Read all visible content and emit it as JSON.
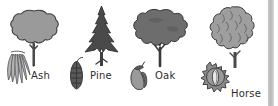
{
  "figure": {
    "kind": "tree-identification-chart",
    "background_color": "#ffffff",
    "ink_color": "#2e2e2e",
    "palette": {
      "canopy_light": "#9a9a9a",
      "canopy_mid": "#8a8a8a",
      "canopy_dark": "#4a4a4a",
      "outline": "#3a3a3a",
      "trunk": "#4a4a4a",
      "seed_light": "#b0b0b0",
      "seed_dark": "#4f4f4f",
      "edge_strip": "#c0c0c0"
    }
  },
  "species": [
    {
      "id": "ash",
      "label": "Ash",
      "tree_icon": "ash-tree-icon",
      "seed_icon": "ash-keys-icon",
      "seed_name": "ash keys",
      "canopy_shape": "rounded lobed",
      "canopy_color": "#9a9a9a"
    },
    {
      "id": "pine",
      "label": "Pine",
      "tree_icon": "pine-tree-icon",
      "seed_icon": "pine-cone-icon",
      "seed_name": "pine cone",
      "canopy_shape": "conical layered",
      "canopy_color": "#4a4a4a"
    },
    {
      "id": "oak",
      "label": "Oak",
      "tree_icon": "oak-tree-icon",
      "seed_icon": "acorn-icon",
      "seed_name": "acorn",
      "canopy_shape": "broad irregular spreading",
      "canopy_color": "#6d6d6d"
    },
    {
      "id": "horse-chestnut",
      "label_line1": "Horse",
      "label_line2": "chestnut",
      "tree_icon": "horse-chestnut-tree-icon",
      "seed_icon": "conker-case-icon",
      "seed_name": "conker case",
      "canopy_shape": "tall domed textured",
      "canopy_color": "#9e9e9e"
    }
  ]
}
